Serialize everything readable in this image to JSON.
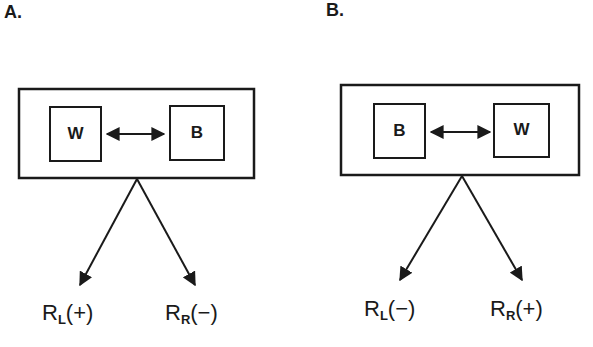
{
  "panels": [
    {
      "label": "A.",
      "left_stimulus": "W",
      "right_stimulus": "B",
      "responses": [
        {
          "base": "R",
          "sub": "L",
          "sign": "(+)"
        },
        {
          "base": "R",
          "sub": "R",
          "sign": "(−)"
        }
      ]
    },
    {
      "label": "B.",
      "left_stimulus": "B",
      "right_stimulus": "W",
      "responses": [
        {
          "base": "R",
          "sub": "L",
          "sign": "(−)"
        },
        {
          "base": "R",
          "sub": "R",
          "sign": "(+)"
        }
      ]
    }
  ],
  "colors": {
    "ink": "#1a1a1a",
    "background": "#ffffff"
  }
}
